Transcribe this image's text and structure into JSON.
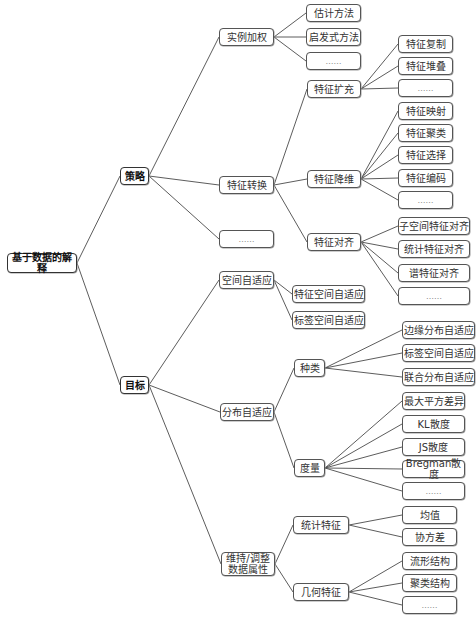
{
  "diagram": {
    "type": "mind-map tree (left-to-right)",
    "root": "基于数据的解释",
    "nodes": [
      {
        "id": "root",
        "label": "基于数据的解释",
        "x": 7,
        "y": 253,
        "w": 70,
        "h": 20,
        "bold": true
      },
      {
        "id": "celue",
        "label": "策略",
        "x": 120,
        "y": 167,
        "w": 29,
        "h": 18,
        "bold": true,
        "parent": "root"
      },
      {
        "id": "mubiao",
        "label": "目标",
        "x": 120,
        "y": 376,
        "w": 29,
        "h": 18,
        "bold": true,
        "parent": "root"
      },
      {
        "id": "slqj",
        "label": "实例加权",
        "x": 219,
        "y": 28,
        "w": 55,
        "h": 18,
        "parent": "celue"
      },
      {
        "id": "tzzh",
        "label": "特征转换",
        "x": 219,
        "y": 176,
        "w": 55,
        "h": 18,
        "parent": "celue"
      },
      {
        "id": "cl_more",
        "label": "……",
        "x": 219,
        "y": 230,
        "w": 55,
        "h": 18,
        "dots": true,
        "parent": "celue"
      },
      {
        "id": "gjff",
        "label": "估计方法",
        "x": 306,
        "y": 4,
        "w": 55,
        "h": 18,
        "parent": "slqj"
      },
      {
        "id": "qfsff",
        "label": "启发式方法",
        "x": 306,
        "y": 28,
        "w": 55,
        "h": 18,
        "parent": "slqj"
      },
      {
        "id": "sl_more",
        "label": "……",
        "x": 306,
        "y": 52,
        "w": 55,
        "h": 18,
        "dots": true,
        "parent": "slqj"
      },
      {
        "id": "tzkc",
        "label": "特征扩充",
        "x": 307,
        "y": 80,
        "w": 54,
        "h": 18,
        "parent": "tzzh"
      },
      {
        "id": "tzjw",
        "label": "特征降维",
        "x": 307,
        "y": 170,
        "w": 54,
        "h": 18,
        "parent": "tzzh"
      },
      {
        "id": "tzdq",
        "label": "特征对齐",
        "x": 307,
        "y": 233,
        "w": 54,
        "h": 18,
        "parent": "tzzh"
      },
      {
        "id": "tzfz",
        "label": "特征复制",
        "x": 398,
        "y": 35,
        "w": 55,
        "h": 18,
        "parent": "tzkc"
      },
      {
        "id": "tzdd",
        "label": "特征堆叠",
        "x": 398,
        "y": 57,
        "w": 55,
        "h": 18,
        "parent": "tzkc"
      },
      {
        "id": "kc_more",
        "label": "……",
        "x": 398,
        "y": 79,
        "w": 55,
        "h": 18,
        "dots": true,
        "parent": "tzkc"
      },
      {
        "id": "tzys",
        "label": "特征映射",
        "x": 398,
        "y": 102,
        "w": 55,
        "h": 18,
        "parent": "tzjw"
      },
      {
        "id": "tzjl",
        "label": "特征聚类",
        "x": 398,
        "y": 124,
        "w": 55,
        "h": 18,
        "parent": "tzjw"
      },
      {
        "id": "tzxz",
        "label": "特征选择",
        "x": 398,
        "y": 146,
        "w": 55,
        "h": 18,
        "parent": "tzjw"
      },
      {
        "id": "tzbm",
        "label": "特征编码",
        "x": 398,
        "y": 169,
        "w": 55,
        "h": 18,
        "parent": "tzjw"
      },
      {
        "id": "jw_more",
        "label": "……",
        "x": 398,
        "y": 191,
        "w": 55,
        "h": 18,
        "dots": true,
        "parent": "tzjw"
      },
      {
        "id": "zkj",
        "label": "子空间特征对齐",
        "x": 398,
        "y": 217,
        "w": 72,
        "h": 18,
        "parent": "tzdq"
      },
      {
        "id": "tjtz",
        "label": "统计特征对齐",
        "x": 398,
        "y": 240,
        "w": 72,
        "h": 18,
        "parent": "tzdq"
      },
      {
        "id": "ptz",
        "label": "谱特征对齐",
        "x": 398,
        "y": 264,
        "w": 72,
        "h": 18,
        "parent": "tzdq"
      },
      {
        "id": "dq_more",
        "label": "……",
        "x": 398,
        "y": 287,
        "w": 72,
        "h": 18,
        "dots": true,
        "parent": "tzdq"
      },
      {
        "id": "kjzsy",
        "label": "空间自适应",
        "x": 219,
        "y": 271,
        "w": 55,
        "h": 18,
        "parent": "mubiao"
      },
      {
        "id": "fbzsy",
        "label": "分布自适应",
        "x": 220,
        "y": 403,
        "w": 54,
        "h": 18,
        "parent": "mubiao"
      },
      {
        "id": "wcsx",
        "label": "维持/调整\n数据属性",
        "x": 221,
        "y": 552,
        "w": 54,
        "h": 24,
        "parent": "mubiao"
      },
      {
        "id": "tzkjzsy",
        "label": "特征空间自适应",
        "x": 292,
        "y": 285,
        "w": 73,
        "h": 18,
        "parent": "kjzsy"
      },
      {
        "id": "bqkjzsy",
        "label": "标签空间自适应",
        "x": 292,
        "y": 311,
        "w": 73,
        "h": 18,
        "parent": "kjzsy"
      },
      {
        "id": "zl",
        "label": "种类",
        "x": 294,
        "y": 359,
        "w": 31,
        "h": 18,
        "parent": "fbzsy"
      },
      {
        "id": "dl",
        "label": "度量",
        "x": 294,
        "y": 459,
        "w": 31,
        "h": 18,
        "parent": "fbzsy"
      },
      {
        "id": "byfb",
        "label": "边缘分布自适应",
        "x": 402,
        "y": 321,
        "w": 73,
        "h": 18,
        "parent": "zl"
      },
      {
        "id": "bqkj2",
        "label": "标签空间自适应",
        "x": 402,
        "y": 344,
        "w": 73,
        "h": 18,
        "parent": "zl"
      },
      {
        "id": "lhfb",
        "label": "联合分布自适应",
        "x": 402,
        "y": 368,
        "w": 73,
        "h": 18,
        "parent": "zl"
      },
      {
        "id": "zdpf",
        "label": "最大平方差异",
        "x": 402,
        "y": 392,
        "w": 63,
        "h": 18,
        "parent": "dl"
      },
      {
        "id": "kl",
        "label": "KL散度",
        "x": 402,
        "y": 415,
        "w": 63,
        "h": 18,
        "parent": "dl"
      },
      {
        "id": "js",
        "label": "JS散度",
        "x": 402,
        "y": 438,
        "w": 63,
        "h": 18,
        "parent": "dl"
      },
      {
        "id": "breg",
        "label": "Bregman散度",
        "x": 402,
        "y": 460,
        "w": 63,
        "h": 18,
        "parent": "dl"
      },
      {
        "id": "dl_more",
        "label": "……",
        "x": 402,
        "y": 482,
        "w": 63,
        "h": 18,
        "dots": true,
        "parent": "dl"
      },
      {
        "id": "tjtz2",
        "label": "统计特征",
        "x": 293,
        "y": 516,
        "w": 56,
        "h": 18,
        "parent": "wcsx"
      },
      {
        "id": "jhtz",
        "label": "几何特征",
        "x": 293,
        "y": 583,
        "w": 56,
        "h": 18,
        "parent": "wcsx"
      },
      {
        "id": "jz",
        "label": "均值",
        "x": 402,
        "y": 506,
        "w": 55,
        "h": 18,
        "parent": "tjtz2"
      },
      {
        "id": "xfc",
        "label": "协方差",
        "x": 402,
        "y": 528,
        "w": 55,
        "h": 18,
        "parent": "tjtz2"
      },
      {
        "id": "lxjg",
        "label": "流形结构",
        "x": 402,
        "y": 552,
        "w": 55,
        "h": 18,
        "parent": "jhtz"
      },
      {
        "id": "jljg",
        "label": "聚类结构",
        "x": 402,
        "y": 574,
        "w": 55,
        "h": 18,
        "parent": "jhtz"
      },
      {
        "id": "jh_more",
        "label": "……",
        "x": 402,
        "y": 596,
        "w": 55,
        "h": 18,
        "dots": true,
        "parent": "jhtz"
      }
    ]
  },
  "colors": {
    "background": "#ffffff",
    "border": "#555555",
    "line": "#4a4a4a",
    "text": "#333333"
  }
}
